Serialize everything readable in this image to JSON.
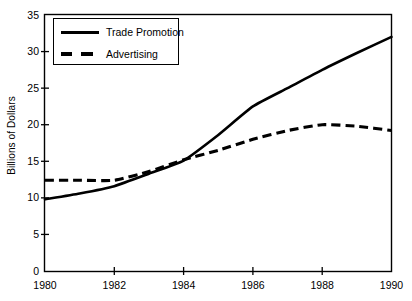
{
  "chart_data": {
    "type": "line",
    "title": "",
    "xlabel": "",
    "ylabel": "Billions of Dollars",
    "xlim": [
      1980,
      1990
    ],
    "ylim": [
      0,
      35
    ],
    "yticks": [
      0,
      5,
      10,
      15,
      20,
      25,
      30,
      35
    ],
    "xticks": [
      1980,
      1982,
      1984,
      1986,
      1988,
      1990
    ],
    "ytick_labels": [
      "0",
      "5",
      "10",
      "15",
      "20",
      "25",
      "30",
      "35"
    ],
    "xtick_labels": [
      "1980",
      "1982",
      "1984",
      "1986",
      "1988",
      "1990"
    ],
    "grid": false,
    "legend_position": "upper left inside axes",
    "x": [
      1980,
      1981,
      1982,
      1983,
      1984,
      1985,
      1986,
      1987,
      1988,
      1989,
      1990
    ],
    "series": [
      {
        "name": "Trade Promotion",
        "style": "solid",
        "color": "#000000",
        "values": [
          9.8,
          10.6,
          11.6,
          13.3,
          15.1,
          18.6,
          22.5,
          25.0,
          27.5,
          29.8,
          32.0
        ]
      },
      {
        "name": "Advertising",
        "style": "dashed",
        "color": "#000000",
        "values": [
          12.4,
          12.4,
          12.4,
          13.6,
          15.2,
          16.5,
          18.0,
          19.2,
          20.0,
          19.8,
          19.2
        ]
      }
    ]
  },
  "legend": {
    "items": [
      {
        "label": "Trade Promotion",
        "style": "solid"
      },
      {
        "label": "Advertising",
        "style": "dashed"
      }
    ]
  },
  "colors": {
    "axis": "#000000",
    "background": "#ffffff",
    "line": "#000000"
  }
}
